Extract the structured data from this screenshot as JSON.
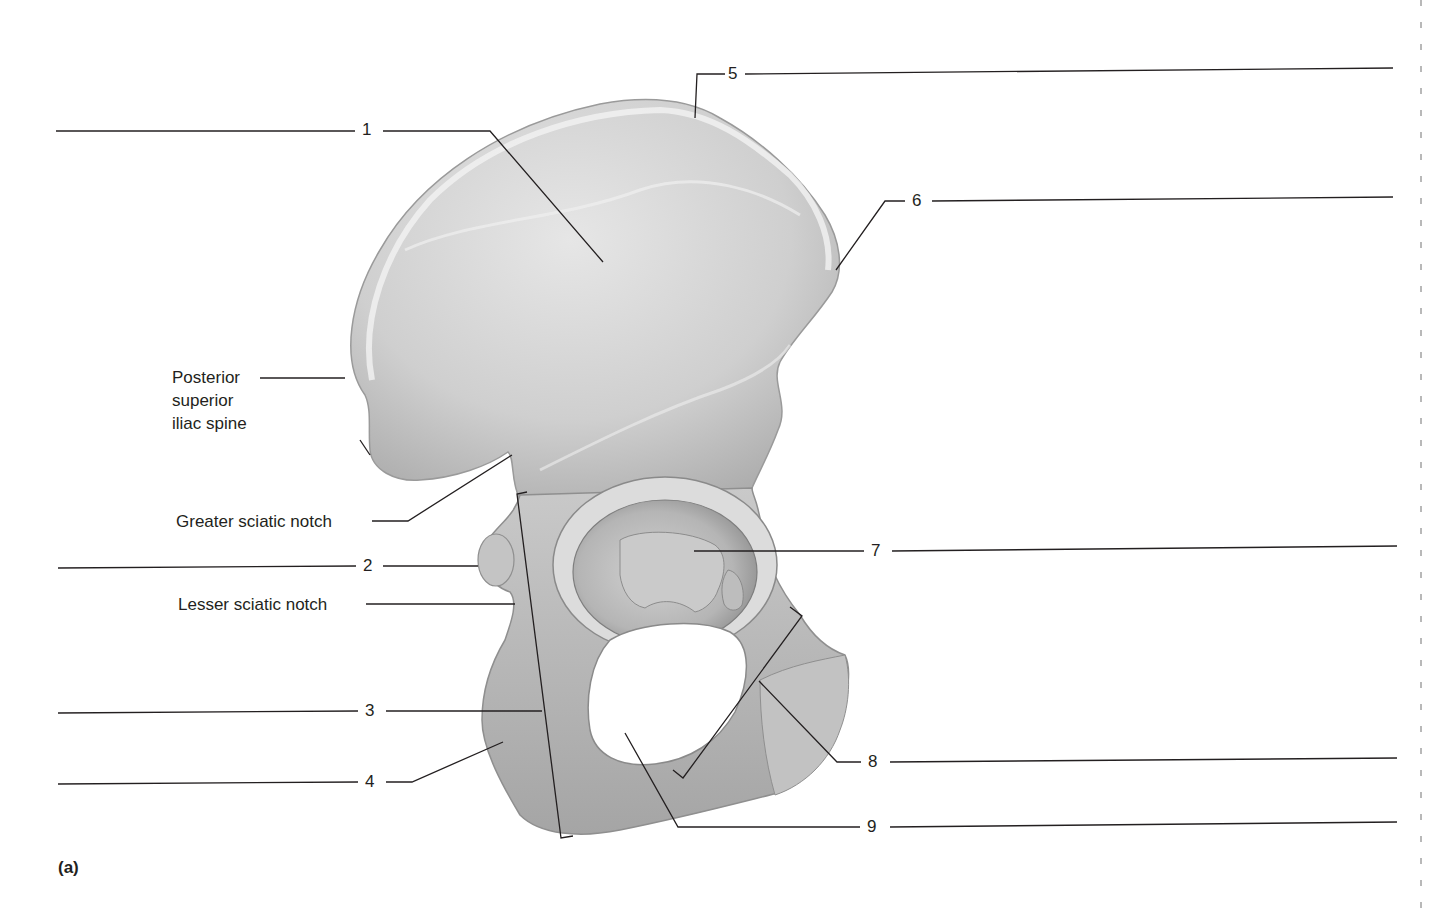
{
  "figure": {
    "panel_label": "(a)",
    "colors": {
      "bone": "#d8d8d8",
      "bone_shadow": "#9c9c9c",
      "bone_highlight": "#f4f4f4",
      "leader_line": "#231f20",
      "text": "#231f20",
      "background": "#ffffff"
    }
  },
  "labels": [
    {
      "id": "posterior-superior-iliac-spine",
      "text_lines": [
        "Posterior",
        "superior",
        "iliac spine"
      ]
    },
    {
      "id": "greater-sciatic-notch",
      "text": "Greater sciatic notch"
    },
    {
      "id": "lesser-sciatic-notch",
      "text": "Lesser sciatic notch"
    }
  ],
  "numbered_callouts": [
    {
      "number": "1",
      "answer_blank": ""
    },
    {
      "number": "2",
      "answer_blank": ""
    },
    {
      "number": "3",
      "answer_blank": ""
    },
    {
      "number": "4",
      "answer_blank": ""
    },
    {
      "number": "5",
      "answer_blank": ""
    },
    {
      "number": "6",
      "answer_blank": ""
    },
    {
      "number": "7",
      "answer_blank": ""
    },
    {
      "number": "8",
      "answer_blank": ""
    },
    {
      "number": "9",
      "answer_blank": ""
    }
  ]
}
